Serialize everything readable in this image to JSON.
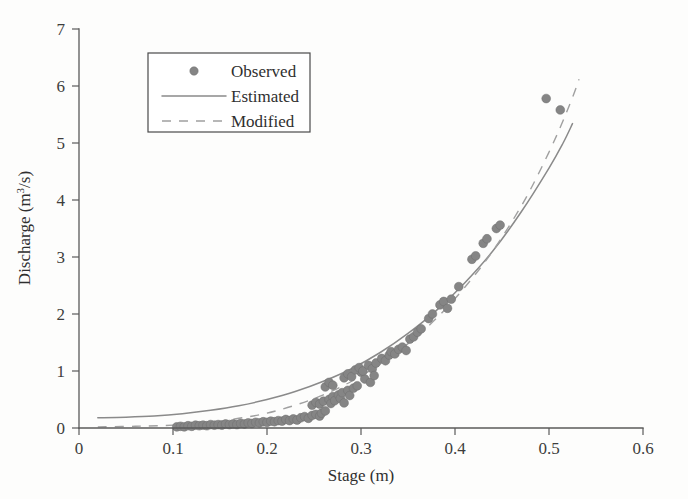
{
  "chart_data": {
    "type": "scatter",
    "title": "",
    "xlabel": "Stage (m)",
    "ylabel": "Discharge (m³/s)",
    "ylabel_parts": {
      "base": "Discharge (m",
      "sup": "3",
      "tail": "/s)"
    },
    "xlim": [
      0,
      0.6
    ],
    "ylim": [
      0,
      7
    ],
    "xticks": [
      0,
      0.1,
      0.2,
      0.3,
      0.4,
      0.5,
      0.6
    ],
    "xtick_labels": [
      "0",
      "0.1",
      "0.2",
      "0.3",
      "0.4",
      "0.5",
      "0.6"
    ],
    "yticks": [
      0,
      1,
      2,
      3,
      4,
      5,
      6,
      7
    ],
    "ytick_labels": [
      "0",
      "1",
      "2",
      "3",
      "4",
      "5",
      "6",
      "7"
    ],
    "grid": false,
    "legend_position": "upper-left-inset",
    "legend": [
      {
        "label": "Observed",
        "marker": "circle",
        "style": "marker",
        "color": "#858585"
      },
      {
        "label": "Estimated",
        "marker": "line",
        "style": "solid",
        "color": "#8a8a8a"
      },
      {
        "label": "Modified",
        "marker": "line",
        "style": "dashed",
        "color": "#a0a0a0"
      }
    ],
    "series": [
      {
        "name": "Observed",
        "type": "scatter",
        "points": [
          [
            0.104,
            0.02
          ],
          [
            0.108,
            0.03
          ],
          [
            0.112,
            0.02
          ],
          [
            0.116,
            0.04
          ],
          [
            0.12,
            0.03
          ],
          [
            0.124,
            0.05
          ],
          [
            0.128,
            0.04
          ],
          [
            0.132,
            0.05
          ],
          [
            0.136,
            0.04
          ],
          [
            0.14,
            0.06
          ],
          [
            0.144,
            0.05
          ],
          [
            0.148,
            0.06
          ],
          [
            0.152,
            0.05
          ],
          [
            0.156,
            0.07
          ],
          [
            0.16,
            0.06
          ],
          [
            0.164,
            0.07
          ],
          [
            0.168,
            0.06
          ],
          [
            0.172,
            0.08
          ],
          [
            0.176,
            0.07
          ],
          [
            0.18,
            0.09
          ],
          [
            0.184,
            0.08
          ],
          [
            0.188,
            0.1
          ],
          [
            0.192,
            0.09
          ],
          [
            0.196,
            0.11
          ],
          [
            0.2,
            0.1
          ],
          [
            0.204,
            0.12
          ],
          [
            0.208,
            0.11
          ],
          [
            0.212,
            0.13
          ],
          [
            0.216,
            0.12
          ],
          [
            0.22,
            0.15
          ],
          [
            0.224,
            0.13
          ],
          [
            0.228,
            0.16
          ],
          [
            0.232,
            0.14
          ],
          [
            0.236,
            0.18
          ],
          [
            0.24,
            0.2
          ],
          [
            0.244,
            0.17
          ],
          [
            0.248,
            0.22
          ],
          [
            0.252,
            0.24
          ],
          [
            0.256,
            0.21
          ],
          [
            0.258,
            0.26
          ],
          [
            0.248,
            0.4
          ],
          [
            0.252,
            0.45
          ],
          [
            0.256,
            0.42
          ],
          [
            0.26,
            0.47
          ],
          [
            0.262,
            0.3
          ],
          [
            0.266,
            0.5
          ],
          [
            0.268,
            0.43
          ],
          [
            0.27,
            0.55
          ],
          [
            0.272,
            0.48
          ],
          [
            0.276,
            0.58
          ],
          [
            0.278,
            0.52
          ],
          [
            0.28,
            0.62
          ],
          [
            0.282,
            0.44
          ],
          [
            0.286,
            0.66
          ],
          [
            0.288,
            0.57
          ],
          [
            0.292,
            0.7
          ],
          [
            0.262,
            0.72
          ],
          [
            0.266,
            0.8
          ],
          [
            0.27,
            0.75
          ],
          [
            0.282,
            0.88
          ],
          [
            0.286,
            0.95
          ],
          [
            0.29,
            0.9
          ],
          [
            0.296,
            0.74
          ],
          [
            0.3,
            0.98
          ],
          [
            0.304,
            0.86
          ],
          [
            0.294,
            1.02
          ],
          [
            0.298,
            1.06
          ],
          [
            0.302,
            1.0
          ],
          [
            0.308,
            1.1
          ],
          [
            0.312,
            1.04
          ],
          [
            0.316,
            1.14
          ],
          [
            0.31,
            0.8
          ],
          [
            0.314,
            0.92
          ],
          [
            0.322,
            1.22
          ],
          [
            0.326,
            1.18
          ],
          [
            0.33,
            1.28
          ],
          [
            0.332,
            1.34
          ],
          [
            0.336,
            1.3
          ],
          [
            0.34,
            1.38
          ],
          [
            0.344,
            1.42
          ],
          [
            0.348,
            1.36
          ],
          [
            0.352,
            1.56
          ],
          [
            0.356,
            1.6
          ],
          [
            0.36,
            1.68
          ],
          [
            0.364,
            1.74
          ],
          [
            0.372,
            1.92
          ],
          [
            0.376,
            2.0
          ],
          [
            0.384,
            2.16
          ],
          [
            0.388,
            2.22
          ],
          [
            0.392,
            2.1
          ],
          [
            0.396,
            2.26
          ],
          [
            0.404,
            2.48
          ],
          [
            0.418,
            2.96
          ],
          [
            0.422,
            3.02
          ],
          [
            0.43,
            3.24
          ],
          [
            0.434,
            3.32
          ],
          [
            0.444,
            3.5
          ],
          [
            0.448,
            3.56
          ],
          [
            0.497,
            5.78
          ],
          [
            0.512,
            5.58
          ]
        ]
      },
      {
        "name": "Estimated",
        "type": "line",
        "style": "solid",
        "points": [
          [
            0.02,
            0.18
          ],
          [
            0.05,
            0.19
          ],
          [
            0.08,
            0.21
          ],
          [
            0.11,
            0.25
          ],
          [
            0.14,
            0.31
          ],
          [
            0.17,
            0.39
          ],
          [
            0.2,
            0.5
          ],
          [
            0.23,
            0.64
          ],
          [
            0.26,
            0.82
          ],
          [
            0.29,
            1.04
          ],
          [
            0.32,
            1.32
          ],
          [
            0.35,
            1.66
          ],
          [
            0.38,
            2.06
          ],
          [
            0.41,
            2.54
          ],
          [
            0.44,
            3.1
          ],
          [
            0.47,
            3.78
          ],
          [
            0.5,
            4.56
          ],
          [
            0.515,
            5.0
          ],
          [
            0.525,
            5.34
          ]
        ]
      },
      {
        "name": "Modified",
        "type": "line",
        "style": "dashed",
        "points": [
          [
            0.02,
            0.02
          ],
          [
            0.06,
            0.03
          ],
          [
            0.1,
            0.05
          ],
          [
            0.14,
            0.1
          ],
          [
            0.17,
            0.17
          ],
          [
            0.2,
            0.26
          ],
          [
            0.23,
            0.4
          ],
          [
            0.26,
            0.58
          ],
          [
            0.29,
            0.82
          ],
          [
            0.32,
            1.12
          ],
          [
            0.35,
            1.48
          ],
          [
            0.38,
            1.92
          ],
          [
            0.41,
            2.46
          ],
          [
            0.44,
            3.1
          ],
          [
            0.47,
            3.88
          ],
          [
            0.49,
            4.5
          ],
          [
            0.51,
            5.2
          ],
          [
            0.525,
            5.8
          ],
          [
            0.532,
            6.12
          ]
        ]
      }
    ]
  }
}
